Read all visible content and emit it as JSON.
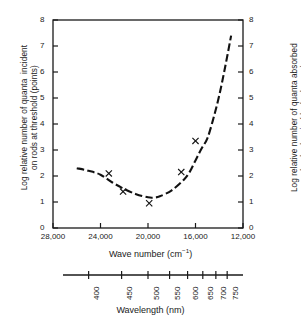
{
  "chart_data": {
    "type": "line",
    "title": "",
    "xlabel": "Wave number (cm⁻¹)",
    "ylabel": "Log relative number of quanta incident\non rods at threshold (points)",
    "ylabel_right": "Log relative number of quanta absorbed\nby rhodopsin (dashed curve)",
    "secondary_xlabel": "Wavelength (nm)",
    "grid": false,
    "legend": "none",
    "xlim": [
      28000,
      12000
    ],
    "ylim": [
      0,
      8
    ],
    "x_axis_inverted": true,
    "xticks": [
      28000,
      24000,
      20000,
      16000,
      12000
    ],
    "xticklabels": [
      "28,000",
      "24,000",
      "20,000",
      "16,000",
      "12,000"
    ],
    "yticks": [
      0,
      1,
      2,
      3,
      4,
      5,
      6,
      7,
      8
    ],
    "yticklabels": [
      "0",
      "1",
      "2",
      "3",
      "4",
      "5",
      "6",
      "7",
      "8"
    ],
    "yticks_right": [
      0,
      1,
      2,
      3,
      4,
      5,
      6,
      7,
      8
    ],
    "yticklabels_right": [
      "0",
      "1",
      "2",
      "3",
      "4",
      "5",
      "6",
      "7",
      "8"
    ],
    "secondary_xticks": [
      400,
      450,
      500,
      550,
      600,
      650,
      700,
      750
    ],
    "secondary_xticklabels": [
      "400",
      "450",
      "500",
      "550",
      "600",
      "650",
      "700",
      "750"
    ],
    "series": [
      {
        "name": "quanta absorbed by rhodopsin",
        "style": "dashed-curve",
        "x": [
          26000,
          25000,
          24000,
          23000,
          22000,
          21000,
          20000,
          19500,
          19000,
          18000,
          17000,
          16500,
          16000,
          15500,
          15000,
          14500,
          14000,
          13500,
          13000
        ],
        "y": [
          2.3,
          2.2,
          2.05,
          1.75,
          1.5,
          1.3,
          1.18,
          1.17,
          1.22,
          1.45,
          1.85,
          2.15,
          2.6,
          3.05,
          3.45,
          4.2,
          5.1,
          6.2,
          7.4
        ]
      },
      {
        "name": "quanta incident on rods at threshold",
        "style": "points-x",
        "x": [
          23300,
          22100,
          19900,
          17200,
          16000
        ],
        "y": [
          2.1,
          1.4,
          0.95,
          2.15,
          3.35
        ]
      }
    ]
  },
  "axes": {
    "left_label": "Log relative number of quanta  incident\non rods at threshold (points)",
    "right_label": "Log relative number of quanta absorbed\nby rhodopsin (dashed curve)",
    "wavenumber_title_main": "Wave number (cm",
    "wavenumber_title_sup": "−1",
    "wavenumber_title_end": ")",
    "wavelength_title": "Wavelength (nm)"
  },
  "colors": {
    "curve": "#111111",
    "axis": "#1a1a1a",
    "background": "#ffffff"
  }
}
